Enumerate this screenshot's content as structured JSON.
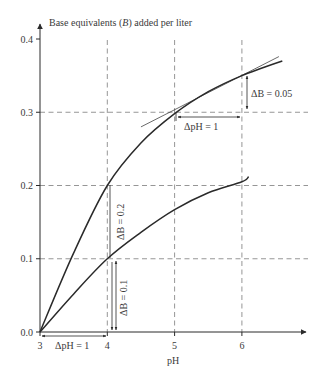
{
  "chart_data": {
    "type": "line",
    "title": "",
    "ylabel": "Base equivalents (B) added per liter",
    "ylabel_parts": {
      "pre": "Base equivalents (",
      "italic": "B",
      "post": ") added per liter"
    },
    "xlabel": "pH",
    "xlim": [
      3,
      6.85
    ],
    "ylim": [
      0,
      0.42
    ],
    "x_ticks": [
      3,
      4,
      5,
      6
    ],
    "x_tick_labels": [
      "3",
      "4",
      "5",
      "6"
    ],
    "y_ticks": [
      0.0,
      0.1,
      0.2,
      0.3,
      0.4
    ],
    "y_tick_labels": [
      "0.0",
      "0.1",
      "0.2",
      "0.3",
      "0.4"
    ],
    "grid": {
      "horizontal": [
        0.1,
        0.2,
        0.3
      ],
      "vertical": [
        4,
        5,
        6
      ],
      "style": "dashed"
    },
    "legend": null,
    "series": [
      {
        "name": "upper curve",
        "x": [
          3.0,
          3.5,
          4.0,
          4.5,
          5.0,
          5.5,
          6.0,
          6.6
        ],
        "y": [
          0.0,
          0.108,
          0.2,
          0.258,
          0.298,
          0.328,
          0.35,
          0.37
        ]
      },
      {
        "name": "lower curve",
        "x": [
          3.0,
          3.5,
          4.0,
          4.5,
          5.0,
          5.5,
          6.0,
          6.1
        ],
        "y": [
          0.0,
          0.052,
          0.1,
          0.136,
          0.167,
          0.19,
          0.205,
          0.212
        ]
      },
      {
        "name": "tangent at pH 6 (upper curve)",
        "x": [
          4.5,
          6.55
        ],
        "y": [
          0.28,
          0.376
        ]
      }
    ],
    "annotations": [
      {
        "text": "ΔpH = 1",
        "type": "horizontal-dimension",
        "x": [
          3,
          4
        ],
        "y": 0.0
      },
      {
        "text": "ΔB = 0.2",
        "type": "vertical-dimension",
        "x": 4.0,
        "y": [
          0.1,
          0.2
        ],
        "rotated": true
      },
      {
        "text": "ΔB = 0.1",
        "type": "vertical-dimension",
        "x": 4.1,
        "y": [
          0.0,
          0.1
        ],
        "rotated": true
      },
      {
        "text": "ΔpH = 1",
        "type": "horizontal-dimension",
        "x": [
          5,
          6
        ],
        "y": 0.3
      },
      {
        "text": "ΔB = 0.05",
        "type": "vertical-dimension",
        "x": 6.03,
        "y": [
          0.3,
          0.35
        ]
      }
    ]
  },
  "labels": {
    "ylabel_pre": "Base equivalents (",
    "ylabel_italic": "B",
    "ylabel_post": ") added per liter",
    "xlabel": "pH",
    "y_ticks": [
      "0.0",
      "0.1",
      "0.2",
      "0.3",
      "0.4"
    ],
    "x_ticks": [
      "3",
      "4",
      "5",
      "6"
    ],
    "anno_dph_bottom": "ΔpH = 1",
    "anno_db_02": "ΔB = 0.2",
    "anno_db_01": "ΔB = 0.1",
    "anno_dph_top": "ΔpH = 1",
    "anno_db_005": "ΔB = 0.05"
  },
  "colors": {
    "ink": "#2a2a2a",
    "grid": "#8a8a8a",
    "text": "#3a3a3a",
    "background": "#ffffff"
  }
}
